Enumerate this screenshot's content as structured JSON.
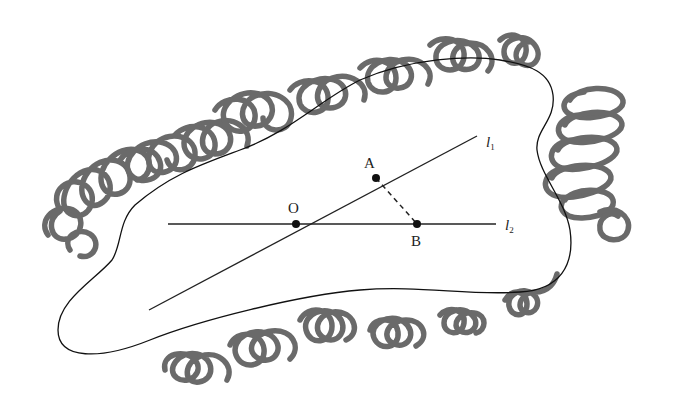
{
  "diagram": {
    "type": "geometry-region",
    "points": {
      "O": {
        "label": "O",
        "x": 296,
        "y": 224
      },
      "A": {
        "label": "A",
        "x": 376,
        "y": 178
      },
      "B": {
        "label": "B",
        "x": 417,
        "y": 224
      }
    },
    "lines": {
      "l1": {
        "label": "l",
        "subscript": "1",
        "from": [
          149,
          310
        ],
        "to": [
          477,
          136
        ]
      },
      "l2": {
        "label": "l",
        "subscript": "2",
        "from": [
          168,
          224
        ],
        "to": [
          496,
          224
        ]
      }
    },
    "segments": [
      {
        "from": "A",
        "to": "B",
        "style": "dashed"
      }
    ],
    "colors": {
      "scribble": "#6a6a6a",
      "ink": "#111111",
      "background": "#ffffff"
    }
  }
}
